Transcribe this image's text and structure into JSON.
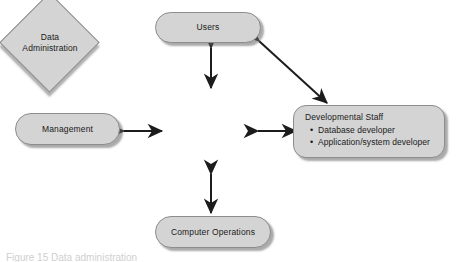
{
  "diagram": {
    "colors": {
      "node_fill": "#d4d4d4",
      "node_stroke": "#8d8d8d",
      "arrow": "#1c1c1c",
      "page_background": "#ffffff",
      "text": "#1a1a1a"
    },
    "nodes": {
      "users": {
        "label": "Users",
        "shape": "rounded-rectangle"
      },
      "management": {
        "label": "Management",
        "shape": "rounded-rectangle"
      },
      "computer_operations": {
        "label": "Computer Operations",
        "shape": "rounded-rectangle"
      },
      "data_administration": {
        "label_line1": "Data",
        "label_line2": "Administration",
        "shape": "diamond"
      },
      "developmental_staff": {
        "title": "Developmental Staff",
        "shape": "rounded-rectangle",
        "bullet_glyph": "•",
        "items": [
          "Database developer",
          "Application/system developer"
        ]
      }
    },
    "connectors": [
      {
        "from": "users",
        "to": "data_administration",
        "style": "double-headed",
        "orientation": "vertical"
      },
      {
        "from": "management",
        "to": "data_administration",
        "style": "double-headed",
        "orientation": "horizontal"
      },
      {
        "from": "data_administration",
        "to": "developmental_staff",
        "style": "double-headed",
        "orientation": "horizontal"
      },
      {
        "from": "data_administration",
        "to": "computer_operations",
        "style": "double-headed",
        "orientation": "vertical"
      },
      {
        "from": "users",
        "to": "developmental_staff",
        "style": "double-headed",
        "orientation": "diagonal"
      }
    ],
    "caption_partial": "Figure 15  Data administration"
  }
}
